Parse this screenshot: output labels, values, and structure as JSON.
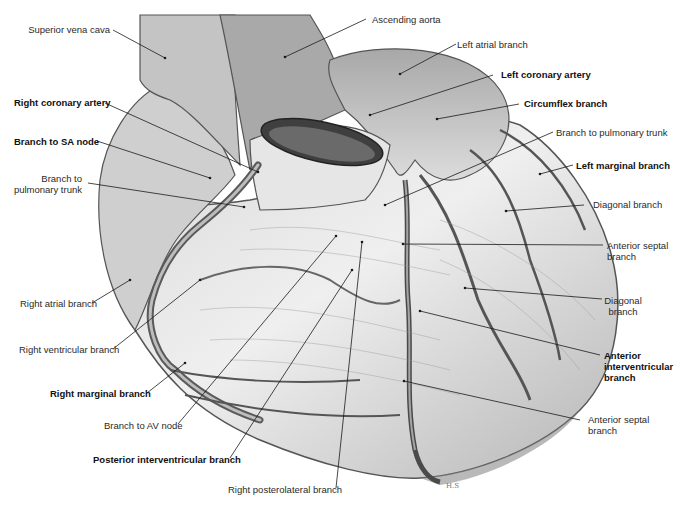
{
  "figure": {
    "signature": "H.S"
  },
  "labels": {
    "superior_vena_cava": "Superior vena cava",
    "right_coronary_artery": "Right coronary artery",
    "branch_to_sa_node": "Branch to SA node",
    "branch_to_pulmonary_trunk_right_l1": "Branch to",
    "branch_to_pulmonary_trunk_right_l2": "pulmonary trunk",
    "right_atrial_branch": "Right atrial branch",
    "right_ventricular_branch": "Right ventricular branch",
    "right_marginal_branch": "Right marginal branch",
    "branch_to_av_node": "Branch to AV node",
    "posterior_interventricular_branch": "Posterior interventricular branch",
    "right_posterolateral_branch": "Right posterolateral branch",
    "ascending_aorta": "Ascending aorta",
    "left_atrial_branch": "Left atrial branch",
    "left_coronary_artery": "Left coronary artery",
    "circumflex_branch": "Circumflex branch",
    "branch_to_pulmonary_trunk_left": "Branch to pulmonary trunk",
    "left_marginal_branch": "Left marginal branch",
    "diagonal_branch_upper": "Diagonal branch",
    "anterior_septal_branch_upper_l1": "Anterior septal",
    "anterior_septal_branch_upper_l2": "branch",
    "diagonal_branch_lower_l1": "Diagonal",
    "diagonal_branch_lower_l2": "branch",
    "anterior_interventricular_branch_l1": "Anterior",
    "anterior_interventricular_branch_l2": "interventricular",
    "anterior_interventricular_branch_l3": "branch",
    "anterior_septal_branch_lower_l1": "Anterior septal",
    "anterior_septal_branch_lower_l2": "branch"
  },
  "colors": {
    "background": "#ffffff",
    "heart_light": "#e2e2e2",
    "heart_mid": "#bdbdbd",
    "heart_dark": "#6e6e6e",
    "vessel": "#4a4a4a",
    "leader_line": "#1a1a1a",
    "text": "#2a2a2a"
  }
}
